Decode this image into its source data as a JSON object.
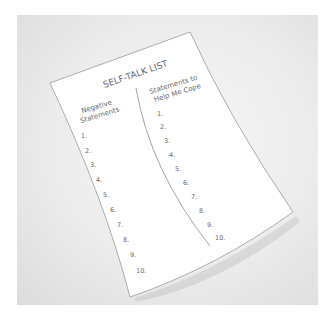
{
  "image": {
    "description": "Photo-illustration of a curled sheet of paper with a self-talk worksheet",
    "background_color": "#e8e8e8",
    "paper_color": "#ffffff",
    "ink_color": "#6a6a6a"
  },
  "worksheet": {
    "title": "SELF-TALK LIST",
    "left_column": {
      "heading_line1": "Negative",
      "heading_line2": "Statements",
      "items": [
        "1.",
        "2.",
        "3.",
        "4.",
        "5.",
        "6.",
        "7.",
        "8.",
        "9.",
        "10."
      ]
    },
    "right_column": {
      "heading_line1": "Statements to",
      "heading_line2": "Help Me Cope",
      "items": [
        "1.",
        "2.",
        "3.",
        "4.",
        "5.",
        "6.",
        "7.",
        "8.",
        "9.",
        "10."
      ]
    }
  }
}
